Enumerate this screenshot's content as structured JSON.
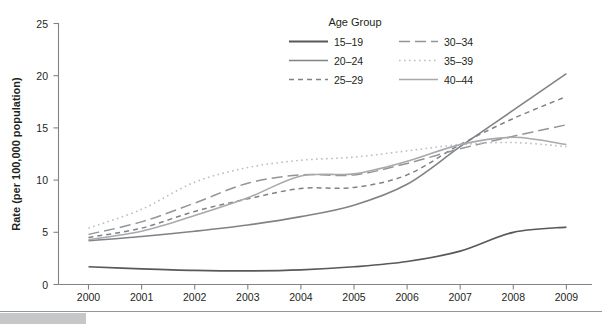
{
  "chart_data": {
    "type": "line",
    "title": "",
    "subtitle": "",
    "xlabel": "",
    "ylabel": "Rate (per 100,000 population)",
    "x": [
      2000,
      2001,
      2002,
      2003,
      2004,
      2005,
      2006,
      2007,
      2008,
      2009
    ],
    "xtick_labels": [
      "2000",
      "2001",
      "2002",
      "2003",
      "2004",
      "2005",
      "2006",
      "2007",
      "2008",
      "2009"
    ],
    "ytick_labels": [
      "0",
      "5",
      "10",
      "15",
      "20",
      "25"
    ],
    "ytick_values": [
      0,
      5,
      10,
      15,
      20,
      25
    ],
    "ylim": [
      0,
      25
    ],
    "xlim": [
      2000,
      2009
    ],
    "grid": false,
    "legend_title": "Age Group",
    "legend_position": "top-right-inside",
    "series": [
      {
        "name": "15–19",
        "values": [
          1.7,
          1.5,
          1.35,
          1.3,
          1.4,
          1.7,
          2.2,
          3.2,
          5.0,
          5.5
        ],
        "style": "solid",
        "color": "#58595b",
        "width": 1.7
      },
      {
        "name": "20–24",
        "values": [
          4.2,
          4.6,
          5.1,
          5.7,
          6.5,
          7.6,
          9.6,
          13.2,
          16.7,
          20.2
        ],
        "style": "solid",
        "color": "#808285",
        "width": 1.6
      },
      {
        "name": "25–29",
        "values": [
          4.5,
          5.4,
          7.0,
          8.2,
          9.2,
          9.3,
          10.5,
          13.4,
          15.9,
          18.0
        ],
        "style": "dashed",
        "color": "#808285",
        "width": 1.5
      },
      {
        "name": "30–34",
        "values": [
          4.8,
          6.0,
          7.8,
          9.7,
          10.5,
          10.5,
          11.6,
          13.0,
          14.2,
          15.3
        ],
        "style": "long-dash",
        "color": "#939598",
        "width": 1.5
      },
      {
        "name": "35–39",
        "values": [
          5.4,
          7.2,
          9.8,
          11.2,
          11.9,
          12.2,
          12.8,
          13.4,
          13.6,
          13.2
        ],
        "style": "dotted",
        "color": "#bcbec0",
        "width": 1.6
      },
      {
        "name": "40–44",
        "values": [
          4.3,
          5.1,
          6.6,
          8.3,
          10.4,
          10.6,
          11.8,
          13.4,
          14.1,
          13.4
        ],
        "style": "solid",
        "color": "#a7a9ac",
        "width": 1.6
      }
    ]
  },
  "legend": {
    "title": "Age Group",
    "entries": [
      {
        "label": "15–19",
        "swatch": "solid-dark-line-swatch"
      },
      {
        "label": "30–34",
        "swatch": "long-dash-line-swatch"
      },
      {
        "label": "20–24",
        "swatch": "solid-gray-line-swatch"
      },
      {
        "label": "35–39",
        "swatch": "dotted-line-swatch"
      },
      {
        "label": "25–29",
        "swatch": "dashed-line-swatch"
      },
      {
        "label": "40–44",
        "swatch": "solid-light-line-swatch"
      }
    ]
  },
  "axes": {
    "y_title": "Rate (per 100,000 population)",
    "y_ticks": [
      "25",
      "20",
      "15",
      "10",
      "5",
      "0"
    ],
    "x_ticks": [
      "2000",
      "2001",
      "2002",
      "2003",
      "2004",
      "2005",
      "2006",
      "2007",
      "2008",
      "2009"
    ]
  },
  "colors": {
    "axis": "#808285",
    "text": "#231f20",
    "series_15_19": "#58595b",
    "series_20_24": "#808285",
    "series_25_29": "#808285",
    "series_30_34": "#939598",
    "series_35_39": "#bcbec0",
    "series_40_44": "#a7a9ac",
    "footer_bar": "#c6c7c9",
    "footer_rule": "#939598"
  }
}
